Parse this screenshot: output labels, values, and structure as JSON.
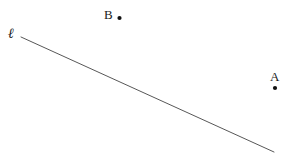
{
  "figure": {
    "width": 297,
    "height": 163,
    "background_color": "#ffffff",
    "stroke_color": "#3a3a3a",
    "text_color": "#1a1a1a"
  },
  "line": {
    "label": "ℓ",
    "label_name": "script-ell",
    "x1": 21,
    "y1": 37,
    "x2": 274,
    "y2": 152,
    "stroke_width": 0.9,
    "stroke_color": "#444444"
  },
  "points": [
    {
      "label": "A",
      "label_x": 270,
      "label_y": 70,
      "dot_x": 275,
      "dot_y": 88,
      "dot_radius": 2.1,
      "color": "#111111"
    },
    {
      "label": "B",
      "label_x": 104,
      "label_y": 8,
      "dot_x": 119.5,
      "dot_y": 18,
      "dot_radius": 2.1,
      "color": "#111111"
    }
  ]
}
